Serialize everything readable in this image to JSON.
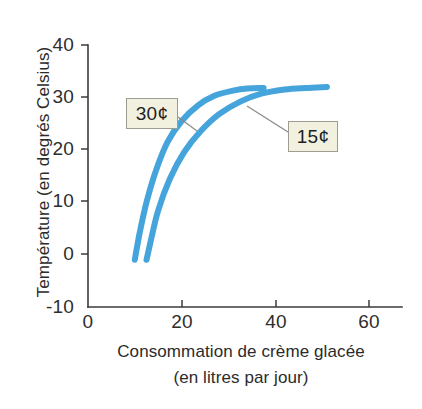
{
  "chart_data": {
    "type": "line",
    "title": "",
    "xlabel": "Consommation de crème glacée",
    "xlabel_line2": "(en litres par jour)",
    "ylabel": "Température (en degrés Celsius)",
    "xlim": [
      0,
      65
    ],
    "ylim": [
      -10,
      40
    ],
    "xticks": [
      "0",
      "20",
      "40",
      "60"
    ],
    "xtick_values": [
      0,
      20,
      40,
      60
    ],
    "yticks": [
      "40",
      "30",
      "20",
      "10",
      "0",
      "-10"
    ],
    "ytick_values": [
      40,
      30,
      20,
      10,
      0,
      -10
    ],
    "grid": false,
    "legend_position": "inline-callouts",
    "series": [
      {
        "name": "30¢",
        "color": "#45a4db",
        "x": [
          10.0,
          11.0,
          12.5,
          14.5,
          17.0,
          20.0,
          23.5,
          27.0,
          31.0,
          34.0,
          37.5
        ],
        "y": [
          -1.0,
          4.0,
          10.0,
          16.0,
          21.5,
          25.5,
          28.5,
          30.3,
          31.3,
          31.7,
          31.8
        ]
      },
      {
        "name": "15¢",
        "color": "#45a4db",
        "x": [
          12.5,
          13.5,
          15.0,
          17.5,
          20.5,
          24.0,
          28.0,
          32.5,
          37.0,
          42.0,
          46.5,
          51.0
        ],
        "y": [
          -1.0,
          3.0,
          8.5,
          14.5,
          19.5,
          23.5,
          26.8,
          29.2,
          30.7,
          31.5,
          31.8,
          32.0
        ]
      }
    ],
    "annotations": [
      {
        "label": "30¢",
        "box_fill": "#f2f1df",
        "box_border": "#9d9d91"
      },
      {
        "label": "15¢",
        "box_fill": "#f2f1df",
        "box_border": "#9d9d91"
      }
    ]
  },
  "axes": {
    "y_title": "Température (en degrés Celsius)",
    "x_title_line1": "Consommation de crème glacée",
    "x_title_line2": "(en litres par jour)",
    "y_tick_labels": [
      "40",
      "30",
      "20",
      "10",
      "0",
      "-10"
    ],
    "x_tick_labels": [
      "0",
      "20",
      "40",
      "60"
    ]
  },
  "callouts": {
    "thirty_cents": "30¢",
    "fifteen_cents": "15¢"
  },
  "colors": {
    "curve": "#45a4db",
    "axis": "#3b3b3b",
    "callout_fill": "#f2f1df",
    "callout_border": "#9d9d91",
    "leader": "#8a8a84",
    "background": "#ffffff"
  }
}
